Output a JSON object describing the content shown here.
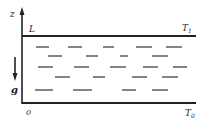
{
  "diagram": {
    "axis_label": "z",
    "top_left_label": "L",
    "top_temperature": "T",
    "top_temperature_sub": "1",
    "bottom_temperature": "T",
    "bottom_temperature_sub": "0",
    "origin_label": "0",
    "gravity_label": "g",
    "colors": {
      "ink": "#222222",
      "background": "#ffffff"
    },
    "dash_rows": [
      {
        "y": 47,
        "segments": [
          [
            36,
            49
          ],
          [
            68,
            82
          ],
          [
            103,
            114
          ],
          [
            136,
            152
          ],
          [
            166,
            182
          ]
        ]
      },
      {
        "y": 56,
        "segments": [
          [
            48,
            62
          ],
          [
            86,
            98
          ],
          [
            120,
            128
          ],
          [
            152,
            168
          ]
        ]
      },
      {
        "y": 67,
        "segments": [
          [
            38,
            53
          ],
          [
            74,
            89
          ],
          [
            110,
            126
          ],
          [
            143,
            158
          ],
          [
            173,
            187
          ]
        ]
      },
      {
        "y": 77,
        "segments": [
          [
            55,
            70
          ],
          [
            93,
            105
          ],
          [
            132,
            147
          ],
          [
            162,
            178
          ]
        ]
      },
      {
        "y": 90,
        "segments": [
          [
            35,
            53
          ],
          [
            73,
            92
          ],
          [
            122,
            136
          ],
          [
            152,
            168
          ]
        ]
      }
    ]
  }
}
